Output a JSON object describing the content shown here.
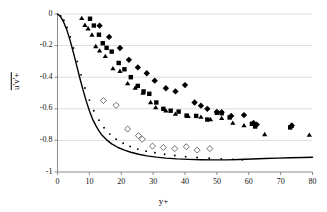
{
  "chart_data": {
    "type": "scatter",
    "title": "",
    "subtitle": "",
    "xlabel": "y+",
    "ylabel": "u'v'+",
    "ylabel_overbar": true,
    "xlim": [
      0,
      80
    ],
    "ylim": [
      -1,
      0
    ],
    "xticks": [
      0,
      10,
      20,
      30,
      40,
      50,
      60,
      70,
      80
    ],
    "yticks": [
      0,
      -0.2,
      -0.4,
      -0.6,
      -0.8,
      -1
    ],
    "xtick_labels": [
      "0",
      "10",
      "20",
      "30",
      "40",
      "50",
      "60",
      "70",
      "80"
    ],
    "ytick_labels": [
      "0",
      "-0.2",
      "-0.4",
      "-0.6",
      "-0.8",
      "-1"
    ],
    "grid": "horizontal",
    "grid_color": "#d9d9d9",
    "axis_color": "#7f7f7f",
    "legend": "none",
    "legend_position": "none",
    "series": [
      {
        "name": "filled-triangle",
        "marker": "triangle",
        "fill": "#000000",
        "size": 4.4,
        "points": [
          [
            7.6,
            -0.027
          ],
          [
            8.6,
            -0.071
          ],
          [
            9.6,
            -0.093
          ],
          [
            10.8,
            -0.132
          ],
          [
            12.0,
            -0.205
          ],
          [
            13.2,
            -0.233
          ],
          [
            15.0,
            -0.268
          ],
          [
            17.4,
            -0.345
          ],
          [
            19.6,
            -0.362
          ],
          [
            22.0,
            -0.44
          ],
          [
            24.4,
            -0.468
          ],
          [
            26.8,
            -0.5
          ],
          [
            29.2,
            -0.56
          ],
          [
            30.8,
            -0.592
          ],
          [
            34.0,
            -0.612
          ],
          [
            37.0,
            -0.633
          ],
          [
            41.0,
            -0.647
          ],
          [
            45.0,
            -0.652
          ],
          [
            48.0,
            -0.668
          ],
          [
            51.5,
            -0.66
          ],
          [
            55.0,
            -0.69
          ],
          [
            58.5,
            -0.706
          ],
          [
            65.0,
            -0.762
          ],
          [
            73.4,
            -0.71
          ],
          [
            79.0,
            -0.766
          ]
        ]
      },
      {
        "name": "filled-square",
        "marker": "square",
        "fill": "#000000",
        "size": 4.4,
        "points": [
          [
            10.2,
            -0.03
          ],
          [
            11.4,
            -0.073
          ],
          [
            13.0,
            -0.131
          ],
          [
            14.2,
            -0.185
          ],
          [
            15.4,
            -0.214
          ],
          [
            17.0,
            -0.238
          ],
          [
            19.2,
            -0.31
          ],
          [
            21.0,
            -0.35
          ],
          [
            23.0,
            -0.4
          ],
          [
            25.2,
            -0.455
          ],
          [
            27.0,
            -0.49
          ],
          [
            28.8,
            -0.505
          ],
          [
            31.0,
            -0.56
          ],
          [
            33.2,
            -0.6
          ],
          [
            35.5,
            -0.612
          ],
          [
            38.0,
            -0.618
          ],
          [
            40.5,
            -0.643
          ],
          [
            43.5,
            -0.645
          ],
          [
            47.0,
            -0.668
          ],
          [
            50.0,
            -0.625
          ],
          [
            51.5,
            -0.628
          ],
          [
            54.0,
            -0.655
          ],
          [
            61.0,
            -0.695
          ],
          [
            62.0,
            -0.712
          ],
          [
            73.0,
            -0.718
          ]
        ]
      },
      {
        "name": "filled-diamond",
        "marker": "diamond",
        "fill": "#000000",
        "size": 4.4,
        "points": [
          [
            13.2,
            -0.074
          ],
          [
            16.2,
            -0.145
          ],
          [
            19.6,
            -0.215
          ],
          [
            22.4,
            -0.29
          ],
          [
            25.2,
            -0.338
          ],
          [
            28.0,
            -0.375
          ],
          [
            30.5,
            -0.422
          ],
          [
            34.0,
            -0.47
          ],
          [
            37.0,
            -0.49
          ],
          [
            40.0,
            -0.45
          ],
          [
            43.0,
            -0.56
          ],
          [
            45.0,
            -0.58
          ],
          [
            47.0,
            -0.6
          ],
          [
            50.0,
            -0.62
          ],
          [
            51.5,
            -0.622
          ],
          [
            54.5,
            -0.645
          ],
          [
            58.5,
            -0.64
          ],
          [
            61.5,
            -0.69
          ],
          [
            62.5,
            -0.7
          ],
          [
            73.5,
            -0.705
          ]
        ]
      },
      {
        "name": "open-diamond",
        "marker": "diamond",
        "fill": "#ffffff",
        "stroke": "#555555",
        "size": 4.2,
        "points": [
          [
            14.4,
            -0.548
          ],
          [
            18.4,
            -0.578
          ],
          [
            22.0,
            -0.728
          ],
          [
            25.4,
            -0.77
          ],
          [
            26.6,
            -0.792
          ],
          [
            29.8,
            -0.836
          ],
          [
            33.2,
            -0.845
          ],
          [
            36.8,
            -0.852
          ],
          [
            40.4,
            -0.84
          ],
          [
            43.8,
            -0.862
          ],
          [
            47.8,
            -0.852
          ]
        ]
      },
      {
        "name": "dotted-line-series",
        "marker": "small-dot",
        "fill": "#000000",
        "size": 1.9,
        "points": [
          [
            1.0,
            -0.012
          ],
          [
            2.0,
            -0.04
          ],
          [
            3.0,
            -0.085
          ],
          [
            4.0,
            -0.145
          ],
          [
            5.0,
            -0.215
          ],
          [
            6.2,
            -0.3
          ],
          [
            7.4,
            -0.385
          ],
          [
            8.6,
            -0.468
          ],
          [
            10.0,
            -0.545
          ],
          [
            11.4,
            -0.612
          ],
          [
            13.0,
            -0.672
          ],
          [
            14.6,
            -0.72
          ],
          [
            16.4,
            -0.76
          ],
          [
            18.4,
            -0.792
          ],
          [
            20.6,
            -0.818
          ],
          [
            22.8,
            -0.838
          ],
          [
            25.2,
            -0.855
          ],
          [
            27.8,
            -0.868
          ],
          [
            30.6,
            -0.878
          ],
          [
            33.6,
            -0.888
          ],
          [
            36.8,
            -0.896
          ],
          [
            40.2,
            -0.903
          ],
          [
            43.8,
            -0.908
          ],
          [
            47.6,
            -0.913
          ],
          [
            51.4,
            -0.917
          ],
          [
            55.0,
            -0.92
          ],
          [
            58.0,
            -0.922
          ]
        ]
      },
      {
        "name": "solid-line",
        "marker": "none",
        "line": "solid",
        "stroke": "#000000",
        "width": 1.4,
        "points": [
          [
            0.0,
            0.0
          ],
          [
            1.0,
            -0.018
          ],
          [
            2.0,
            -0.055
          ],
          [
            3.0,
            -0.105
          ],
          [
            4.0,
            -0.17
          ],
          [
            5.0,
            -0.245
          ],
          [
            6.0,
            -0.325
          ],
          [
            7.0,
            -0.405
          ],
          [
            8.0,
            -0.48
          ],
          [
            9.0,
            -0.55
          ],
          [
            10.0,
            -0.612
          ],
          [
            11.0,
            -0.665
          ],
          [
            12.0,
            -0.705
          ],
          [
            13.0,
            -0.74
          ],
          [
            14.0,
            -0.768
          ],
          [
            15.5,
            -0.798
          ],
          [
            17.0,
            -0.822
          ],
          [
            19.0,
            -0.845
          ],
          [
            21.0,
            -0.862
          ],
          [
            23.0,
            -0.875
          ],
          [
            25.5,
            -0.888
          ],
          [
            28.0,
            -0.898
          ],
          [
            31.0,
            -0.906
          ],
          [
            34.0,
            -0.912
          ],
          [
            37.5,
            -0.917
          ],
          [
            41.0,
            -0.92
          ],
          [
            45.0,
            -0.922
          ],
          [
            49.0,
            -0.923
          ],
          [
            53.0,
            -0.923
          ],
          [
            57.0,
            -0.921
          ],
          [
            61.0,
            -0.918
          ],
          [
            65.0,
            -0.915
          ],
          [
            69.0,
            -0.912
          ],
          [
            73.0,
            -0.91
          ],
          [
            77.0,
            -0.908
          ],
          [
            80.0,
            -0.907
          ]
        ]
      }
    ]
  },
  "axes": {
    "ylabel_text": "u'v'+",
    "xlabel_text": "y+"
  }
}
